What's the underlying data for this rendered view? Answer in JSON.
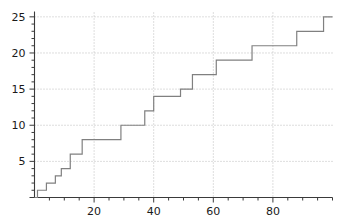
{
  "chart_data": {
    "type": "line",
    "subtype": "step",
    "title": "",
    "xlabel": "",
    "ylabel": "",
    "xlim": [
      0,
      100
    ],
    "ylim": [
      0,
      25.6
    ],
    "grid": true,
    "grid_style": "dotted",
    "grid_color": "#bcbcbc",
    "line_color": "#808080",
    "line_width": 1.2,
    "background": "#ffffff",
    "legend": null,
    "legend_position": "none",
    "x_ticks_major": [
      20,
      40,
      60,
      80
    ],
    "x_tick_labels": [
      "20",
      "40",
      "60",
      "80"
    ],
    "x_ticks_minor_step": 5,
    "y_ticks_major": [
      5,
      10,
      15,
      20,
      25
    ],
    "y_tick_labels": [
      "5",
      "10",
      "15",
      "20",
      "25"
    ],
    "y_ticks_minor_step": 1,
    "axis_color": "#3a3a3a",
    "step_where": "post",
    "x": [
      0,
      1,
      4,
      7,
      9,
      12,
      16,
      29,
      37,
      40,
      49,
      53,
      61,
      73,
      88,
      97,
      100
    ],
    "y": [
      0,
      1,
      2,
      3,
      4,
      6,
      8,
      10,
      12,
      14,
      15,
      17,
      19,
      21,
      23,
      25,
      25
    ],
    "points": [
      {
        "x": 0,
        "y": 0
      },
      {
        "x": 1,
        "y": 1
      },
      {
        "x": 4,
        "y": 2
      },
      {
        "x": 7,
        "y": 3
      },
      {
        "x": 9,
        "y": 4
      },
      {
        "x": 12,
        "y": 6
      },
      {
        "x": 16,
        "y": 8
      },
      {
        "x": 29,
        "y": 10
      },
      {
        "x": 37,
        "y": 12
      },
      {
        "x": 40,
        "y": 14
      },
      {
        "x": 49,
        "y": 15
      },
      {
        "x": 53,
        "y": 17
      },
      {
        "x": 61,
        "y": 19
      },
      {
        "x": 73,
        "y": 21
      },
      {
        "x": 88,
        "y": 23
      },
      {
        "x": 97,
        "y": 25
      }
    ]
  }
}
